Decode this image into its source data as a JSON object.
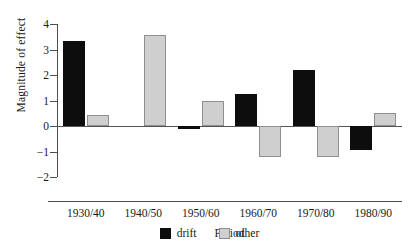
{
  "chart_data": {
    "type": "bar",
    "title": "",
    "xlabel": "Period",
    "ylabel": "Magnitude of effect",
    "categories": [
      "1930/40",
      "1940/50",
      "1950/60",
      "1960/70",
      "1970/80",
      "1980/90"
    ],
    "series": [
      {
        "name": "drift",
        "color": "#0d0d0d",
        "values": [
          3.35,
          0,
          -0.1,
          1.25,
          2.2,
          -0.95
        ]
      },
      {
        "name": "other",
        "color": "#cfcfcf",
        "values": [
          0.45,
          3.55,
          1.0,
          -1.2,
          -1.2,
          0.52
        ]
      }
    ],
    "ylim": [
      -2,
      4
    ],
    "yticks": [
      4,
      3,
      2,
      1,
      0,
      -1,
      -2
    ],
    "ytick_labels": [
      "4",
      "3",
      "2",
      "1",
      "0",
      "−1",
      "−2"
    ],
    "grid": false,
    "legend_position": "bottom",
    "legend": [
      {
        "label": "drift",
        "swatch": "black-square-swatch"
      },
      {
        "label": "other",
        "swatch": "gray-square-swatch"
      }
    ]
  }
}
